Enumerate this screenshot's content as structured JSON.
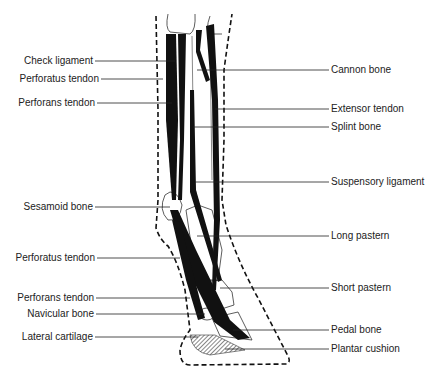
{
  "diagram": {
    "labels_left": [
      {
        "text": "Check ligament",
        "y": 61,
        "line_end_x": 175
      },
      {
        "text": "Perforatus tendon",
        "y": 79,
        "line_end_x": 163
      },
      {
        "text": "Perforans tendon",
        "y": 103,
        "line_end_x": 172
      },
      {
        "text": "Sesamoid bone",
        "y": 207,
        "line_end_x": 170
      },
      {
        "text": "Perforatus tendon",
        "y": 258,
        "line_end_x": 180
      },
      {
        "text": "Perforans tendon",
        "y": 298,
        "line_end_x": 190
      },
      {
        "text": "Navicular bone",
        "y": 314,
        "line_end_x": 205
      },
      {
        "text": "Lateral cartilage",
        "y": 337,
        "line_end_x": 198
      }
    ],
    "labels_right": [
      {
        "text": "Cannon bone",
        "y": 70,
        "line_start_x": 197
      },
      {
        "text": "Extensor tendon",
        "y": 109,
        "line_start_x": 215
      },
      {
        "text": "Splint bone",
        "y": 127,
        "line_start_x": 193
      },
      {
        "text": "Suspensory ligament",
        "y": 182,
        "line_start_x": 195
      },
      {
        "text": "Long pastern",
        "y": 236,
        "line_start_x": 197
      },
      {
        "text": "Short pastern",
        "y": 288,
        "line_start_x": 220
      },
      {
        "text": "Pedal bone",
        "y": 330,
        "line_start_x": 233
      },
      {
        "text": "Plantar cushion",
        "y": 349,
        "line_start_x": 225
      }
    ],
    "colors": {
      "ink": "#111111",
      "text": "#222222",
      "background": "#ffffff"
    }
  }
}
